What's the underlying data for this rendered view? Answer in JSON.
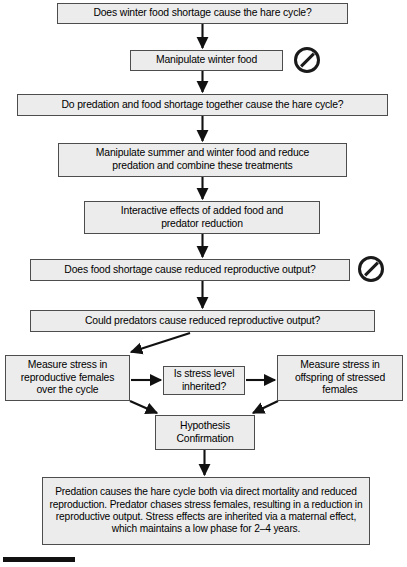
{
  "diagram": {
    "accent_box_fill": "#ececec",
    "accent_box_border": "#4d4d4d",
    "arrow_color": "#111111",
    "badge_color": "#1a1a1a"
  },
  "nodes": {
    "winter_food_question": "Does winter food shortage cause the hare cycle?",
    "manipulate_winter_food": "Manipulate winter food",
    "predation_food_question": "Do predation and food shortage together cause the hare cycle?",
    "manipulate_summer_winter": "Manipulate summer and winter food and reduce\npredation and combine these treatments",
    "interactive_effects": "Interactive effects of added food and\npredator reduction",
    "food_shortage_question": "Does food shortage cause reduced reproductive output?",
    "predators_question": "Could predators cause reduced reproductive output?",
    "measure_stress_females": "Measure stress in\nreproductive females\nover the cycle",
    "stress_inherited_question": "Is stress level\ninherited?",
    "measure_stress_offspring": "Measure stress in\noffspring of stressed\nfemales",
    "hypothesis_confirmation": "Hypothesis\nConfirmation",
    "conclusion": "Predation causes the hare cycle both via direct mortality and reduced reproduction. Predator chases stress females, resulting in a reduction in reproductive output. Stress effects are inherited via a maternal effect, which maintains a low phase for 2–4 years."
  },
  "badges": {
    "manipulate_winter_food_rejected": "no-entry",
    "food_shortage_rejected": "no-entry"
  }
}
